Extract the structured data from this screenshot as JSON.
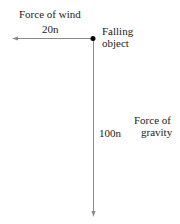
{
  "diagram": {
    "type": "free-body force diagram",
    "object": {
      "label_line1": "Falling",
      "label_line2": "object"
    },
    "forces": [
      {
        "name": "Force of wind",
        "magnitude": "20n",
        "direction": "left"
      },
      {
        "name_line1": "Force of",
        "name_line2": "gravity",
        "magnitude": "100n",
        "direction": "down"
      }
    ],
    "colors": {
      "arrow": "#8a8a8a",
      "dot": "#000000",
      "text": "#222222"
    }
  }
}
